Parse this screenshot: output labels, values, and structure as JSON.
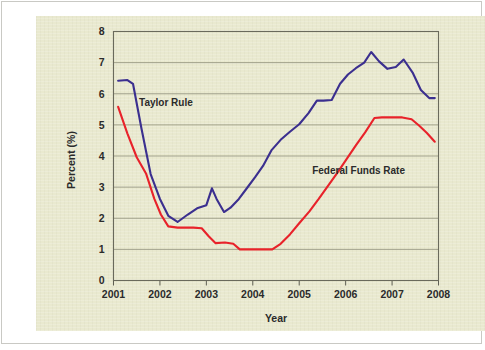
{
  "figure": {
    "background_color": "#e9e9cf",
    "page_color": "#ffffff",
    "border_color": "#c9c9c4"
  },
  "chart_data": {
    "type": "line",
    "title": "",
    "subtitle": "",
    "xlabel": "Year",
    "ylabel": "Percent (%)",
    "xlim": [
      2001,
      2008
    ],
    "ylim": [
      0,
      8
    ],
    "yticks": [
      0,
      1,
      2,
      3,
      4,
      5,
      6,
      7,
      8
    ],
    "ytick_labels": [
      "0",
      "1",
      "2",
      "3",
      "4",
      "5",
      "6",
      "7",
      "8"
    ],
    "xticks": [
      2001,
      2002,
      2003,
      2004,
      2005,
      2006,
      2007,
      2008
    ],
    "xtick_labels": [
      "2001",
      "2002",
      "2003",
      "2004",
      "2005",
      "2006",
      "2007",
      "2008"
    ],
    "grid": "horizontal",
    "grid_color": "#8f8f7a",
    "legend_position": "inline-annotations",
    "series": [
      {
        "name": "Taylor Rule",
        "color": "#3b2f8f",
        "label_x": 2001.55,
        "label_y": 5.62,
        "x": [
          2001.1,
          2001.3,
          2001.42,
          2001.6,
          2001.8,
          2002.0,
          2002.18,
          2002.38,
          2002.6,
          2002.8,
          2003.0,
          2003.12,
          2003.22,
          2003.38,
          2003.52,
          2003.7,
          2003.88,
          2004.05,
          2004.22,
          2004.4,
          2004.6,
          2004.8,
          2005.0,
          2005.2,
          2005.38,
          2005.52,
          2005.7,
          2005.88,
          2006.05,
          2006.22,
          2006.4,
          2006.55,
          2006.72,
          2006.9,
          2007.08,
          2007.25,
          2007.45,
          2007.62,
          2007.8,
          2007.92
        ],
        "y": [
          6.42,
          6.44,
          6.32,
          4.9,
          3.42,
          2.62,
          2.08,
          1.88,
          2.12,
          2.32,
          2.42,
          2.96,
          2.62,
          2.2,
          2.34,
          2.62,
          2.98,
          3.32,
          3.68,
          4.18,
          4.52,
          4.78,
          5.02,
          5.38,
          5.78,
          5.78,
          5.8,
          6.32,
          6.62,
          6.82,
          7.0,
          7.34,
          7.04,
          6.8,
          6.86,
          7.1,
          6.66,
          6.12,
          5.86,
          5.86
        ]
      },
      {
        "name": "Federal Funds Rate",
        "color": "#e8222a",
        "label_x": 2005.28,
        "label_y": 3.42,
        "x": [
          2001.1,
          2001.3,
          2001.5,
          2001.7,
          2001.88,
          2002.02,
          2002.18,
          2002.38,
          2002.58,
          2002.72,
          2002.9,
          2003.05,
          2003.2,
          2003.4,
          2003.58,
          2003.72,
          2003.9,
          2004.1,
          2004.28,
          2004.42,
          2004.6,
          2004.8,
          2005.0,
          2005.22,
          2005.42,
          2005.62,
          2005.82,
          2006.02,
          2006.22,
          2006.42,
          2006.62,
          2006.78,
          2007.0,
          2007.22,
          2007.42,
          2007.58,
          2007.75,
          2007.92
        ],
        "y": [
          5.58,
          4.72,
          3.96,
          3.44,
          2.62,
          2.12,
          1.74,
          1.7,
          1.7,
          1.7,
          1.68,
          1.42,
          1.2,
          1.22,
          1.18,
          1.0,
          1.0,
          1.0,
          1.0,
          1.0,
          1.18,
          1.48,
          1.84,
          2.22,
          2.62,
          3.04,
          3.46,
          3.9,
          4.34,
          4.76,
          5.22,
          5.24,
          5.24,
          5.24,
          5.18,
          4.98,
          4.74,
          4.46
        ]
      }
    ]
  }
}
